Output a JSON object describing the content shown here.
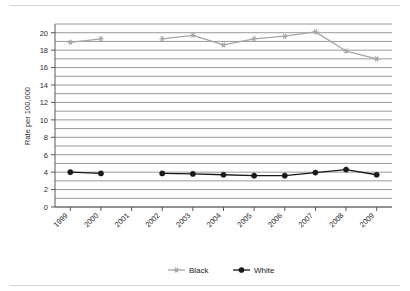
{
  "chart_data": {
    "type": "line",
    "title": "",
    "subtitle": "",
    "xlabel": "",
    "ylabel": "Rate per 100,000",
    "categories": [
      "1999",
      "2000",
      "2001",
      "2002",
      "2003",
      "2004",
      "2005",
      "2006",
      "2007",
      "2008",
      "2009"
    ],
    "x_tick_labels": [
      "1999",
      "2000",
      "2001",
      "2002",
      "2003",
      "2004",
      "2005",
      "2006",
      "2007",
      "2008",
      "2009"
    ],
    "y_tick_labels": [
      "0",
      "2",
      "4",
      "6",
      "8",
      "10",
      "12",
      "14",
      "16",
      "18",
      "20"
    ],
    "y_tick_values": [
      0,
      2,
      4,
      6,
      8,
      10,
      12,
      14,
      16,
      18,
      20
    ],
    "ylim": [
      0,
      21
    ],
    "y_gridline_step": 1,
    "grid": true,
    "legend_position": "bottom-center",
    "series": [
      {
        "name": "Black",
        "color": "#a6a6a6",
        "marker": "star",
        "values": [
          18.9,
          19.3,
          null,
          19.3,
          19.7,
          18.6,
          19.3,
          19.6,
          20.1,
          17.9,
          17.0
        ]
      },
      {
        "name": "White",
        "color": "#1a1a1a",
        "marker": "circle",
        "values": [
          4.0,
          3.85,
          null,
          3.85,
          3.8,
          3.7,
          3.6,
          3.6,
          3.95,
          4.3,
          3.7
        ]
      }
    ]
  },
  "legend": {
    "items": [
      {
        "label": "Black"
      },
      {
        "label": "White"
      }
    ]
  },
  "colors": {
    "black_series": "#a6a6a6",
    "white_series": "#1a1a1a",
    "gridline": "#808080",
    "axis": "#595959",
    "rule": "#d4d4d4"
  }
}
